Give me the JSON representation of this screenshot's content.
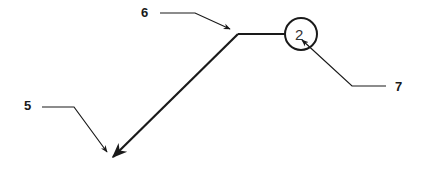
{
  "diagram": {
    "type": "patent-style callout drawing",
    "colors": {
      "stroke": "#1a1a1a",
      "background": "#ffffff"
    },
    "element": {
      "name": "bent-lead-line",
      "description": "Line with horizontal segment ending at a numbered circle, diagonal segment ending in an arrowhead"
    },
    "bubble": {
      "number": "2"
    },
    "callouts": [
      {
        "label": "5",
        "target": "arrow-tip"
      },
      {
        "label": "6",
        "target": "bend-corner"
      },
      {
        "label": "7",
        "target": "numbered-circle"
      }
    ]
  }
}
